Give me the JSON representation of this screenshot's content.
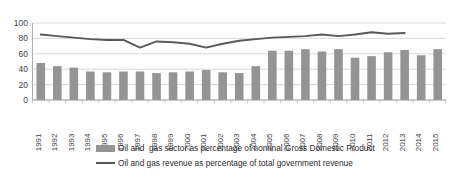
{
  "chart_data": {
    "type": "bar",
    "title": "",
    "xlabel": "",
    "ylabel": "",
    "ylim": [
      0,
      100
    ],
    "ytick_values": [
      0,
      20,
      40,
      60,
      80,
      100
    ],
    "grid": true,
    "legend_position": "bottom",
    "categories": [
      "1991",
      "1992",
      "1993",
      "1994",
      "1995",
      "1996",
      "1997",
      "1998",
      "1999",
      "2000",
      "2001",
      "2002",
      "2003",
      "2004",
      "2005",
      "2006",
      "2007",
      "2008",
      "2009",
      "2010",
      "2011",
      "2012",
      "2013",
      "2014",
      "2015"
    ],
    "series": [
      {
        "name": "Oil and  gas sector as percentage of nominal Gross Domestic Product",
        "type": "bar",
        "color": "#949494",
        "values": [
          48,
          44,
          42,
          37,
          36,
          37,
          37,
          35,
          36,
          37,
          39,
          36,
          35,
          44,
          64,
          64,
          66,
          63,
          66,
          55,
          57,
          62,
          65,
          58,
          66
        ]
      },
      {
        "name": "Oil and gas revenue as percentage of total government revenue",
        "type": "line",
        "color": "#595959",
        "values": [
          85,
          83,
          81,
          79,
          78,
          78,
          68,
          76,
          75,
          73,
          68,
          73,
          77,
          79,
          81,
          82,
          83,
          85,
          83,
          85,
          88,
          86,
          87,
          null,
          null
        ]
      }
    ],
    "legend": [
      {
        "label": "Oil and  gas sector as percentage of nominal Gross Domestic Product",
        "marker": "bar-swatch",
        "color": "#949494"
      },
      {
        "label": "Oil and gas revenue as percentage of total government revenue",
        "marker": "line-swatch",
        "color": "#595959"
      }
    ]
  },
  "colors": {
    "bar": "#949494",
    "line": "#595959",
    "grid": "#c8c8c8",
    "axis": "#9a9a9a",
    "text": "#3f3f3f",
    "background": "#ffffff"
  }
}
